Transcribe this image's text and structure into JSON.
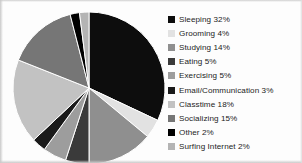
{
  "chart_data": {
    "type": "pie",
    "title": "",
    "subtitle": "",
    "xlabel": "",
    "ylabel": "",
    "grid": false,
    "legend_position": "right",
    "start_angle_deg": 0,
    "direction": "clockwise",
    "categories": [
      "Sleeping",
      "Grooming",
      "Studying",
      "Eating",
      "Exercising",
      "Email/Communication",
      "Classtime",
      "Socializing",
      "Other",
      "Surfing Internet"
    ],
    "values": [
      32,
      4,
      14,
      5,
      5,
      3,
      18,
      15,
      2,
      2
    ],
    "unit": "%",
    "total": 100,
    "colors": [
      "#0d0d0d",
      "#e2e2e2",
      "#8f8f8f",
      "#3a3a3a",
      "#9d9d9d",
      "#1a1a1a",
      "#c2c2c2",
      "#767676",
      "#000000",
      "#b4b4b4"
    ],
    "slices": [
      {
        "label": "Sleeping",
        "value": 32,
        "display": "Sleeping 32%",
        "color": "#0d0d0d"
      },
      {
        "label": "Grooming",
        "value": 4,
        "display": "Grooming 4%",
        "color": "#e2e2e2"
      },
      {
        "label": "Studying",
        "value": 14,
        "display": "Studying 14%",
        "color": "#8f8f8f"
      },
      {
        "label": "Eating",
        "value": 5,
        "display": "Eating 5%",
        "color": "#3a3a3a"
      },
      {
        "label": "Exercising",
        "value": 5,
        "display": "Exercising 5%",
        "color": "#9d9d9d"
      },
      {
        "label": "Email/Communication",
        "value": 3,
        "display": "Email/Communication 3%",
        "color": "#1a1a1a"
      },
      {
        "label": "Classtime",
        "value": 18,
        "display": "Classtime 18%",
        "color": "#c2c2c2"
      },
      {
        "label": "Socializing",
        "value": 15,
        "display": "Socializing 15%",
        "color": "#767676"
      },
      {
        "label": "Other",
        "value": 2,
        "display": "Other 2%",
        "color": "#000000"
      },
      {
        "label": "Surfing Internet",
        "value": 2,
        "display": "Surfing Internet 2%",
        "color": "#b4b4b4"
      }
    ]
  },
  "legend": {
    "items": [
      {
        "label": "Sleeping 32%",
        "swatch_color": "#0d0d0d",
        "swatch_name": "legend-swatch-sleeping"
      },
      {
        "label": "Grooming 4%",
        "swatch_color": "#e2e2e2",
        "swatch_name": "legend-swatch-grooming"
      },
      {
        "label": "Studying 14%",
        "swatch_color": "#8f8f8f",
        "swatch_name": "legend-swatch-studying"
      },
      {
        "label": "Eating 5%",
        "swatch_color": "#3a3a3a",
        "swatch_name": "legend-swatch-eating"
      },
      {
        "label": "Exercising 5%",
        "swatch_color": "#9d9d9d",
        "swatch_name": "legend-swatch-exercising"
      },
      {
        "label": "Email/Communication 3%",
        "swatch_color": "#1a1a1a",
        "swatch_name": "legend-swatch-email"
      },
      {
        "label": "Classtime 18%",
        "swatch_color": "#c2c2c2",
        "swatch_name": "legend-swatch-classtime"
      },
      {
        "label": "Socializing 15%",
        "swatch_color": "#767676",
        "swatch_name": "legend-swatch-socializing"
      },
      {
        "label": "Other 2%",
        "swatch_color": "#000000",
        "swatch_name": "legend-swatch-other"
      },
      {
        "label": "Surfing Internet 2%",
        "swatch_color": "#b4b4b4",
        "swatch_name": "legend-swatch-surfing-internet"
      }
    ]
  },
  "pie_geometry": {
    "center_x": 81,
    "center_y": 80,
    "radius": 76
  }
}
